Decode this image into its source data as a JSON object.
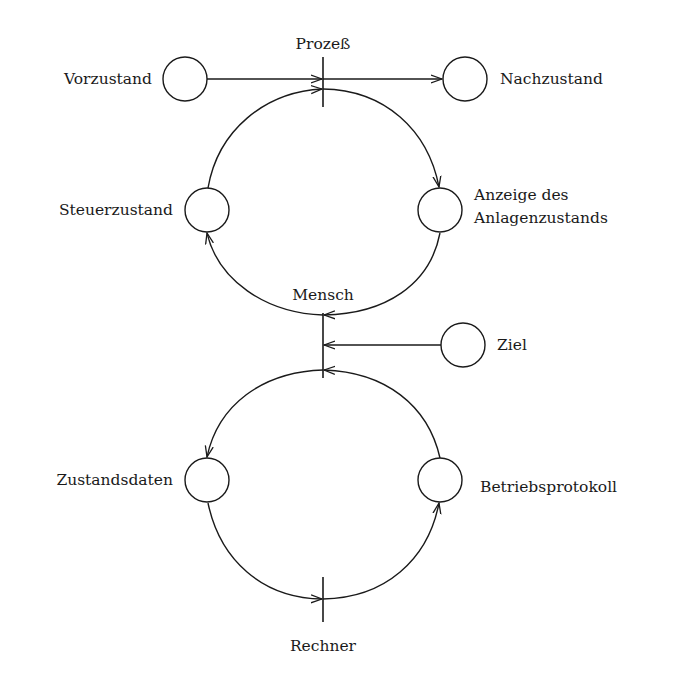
{
  "diagram": {
    "type": "petri-net",
    "transitions": [
      {
        "id": "prozess",
        "label": "Prozeß"
      },
      {
        "id": "mensch",
        "label": "Mensch"
      },
      {
        "id": "rechner",
        "label": "Rechner"
      }
    ],
    "places": [
      {
        "id": "vorzustand",
        "label": "Vorzustand"
      },
      {
        "id": "nachzustand",
        "label": "Nachzustand"
      },
      {
        "id": "steuerzustand",
        "label": "Steuerzustand"
      },
      {
        "id": "anzeige",
        "label_line1": "Anzeige des",
        "label_line2": "Anlagenzustands"
      },
      {
        "id": "ziel",
        "label": "Ziel"
      },
      {
        "id": "zustandsdaten",
        "label": "Zustandsdaten"
      },
      {
        "id": "betriebsprotokoll",
        "label": "Betriebsprotokoll"
      }
    ],
    "arcs": [
      {
        "from": "Vorzustand",
        "to": "Prozeß"
      },
      {
        "from": "Prozeß",
        "to": "Nachzustand"
      },
      {
        "from": "Steuerzustand",
        "to": "Prozeß"
      },
      {
        "from": "Prozeß",
        "to": "Anzeige des Anlagenzustands"
      },
      {
        "from": "Anzeige des Anlagenzustands",
        "to": "Mensch"
      },
      {
        "from": "Mensch",
        "to": "Steuerzustand"
      },
      {
        "from": "Ziel",
        "to": "Mensch"
      },
      {
        "from": "Betriebsprotokoll",
        "to": "Mensch"
      },
      {
        "from": "Mensch",
        "to": "Zustandsdaten"
      },
      {
        "from": "Zustandsdaten",
        "to": "Rechner"
      },
      {
        "from": "Rechner",
        "to": "Betriebsprotokoll"
      }
    ]
  }
}
